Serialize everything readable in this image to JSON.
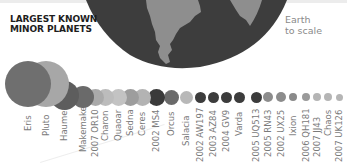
{
  "header": {
    "title_line1": "LARGEST KNOWN",
    "title_line2": "MINOR PLANETS"
  },
  "earth": {
    "label_line1": "Earth",
    "label_line2": "to scale",
    "icon": "earth-globe-icon",
    "ocean_color": "#3d3d3d",
    "land_color": "#8e8e8e"
  },
  "chart_data": {
    "type": "bubble",
    "title": "Largest Known Minor Planets",
    "note": "Earth to scale",
    "categories": [
      "Eris",
      "Pluto",
      "Haumea",
      "Makemake",
      "2007 OR10",
      "Charon",
      "Quaoar",
      "Sedna",
      "Ceres",
      "2002 MS4",
      "Orcus",
      "Salacia",
      "2002 AW197",
      "2003 AZ84",
      "2004 GV9",
      "Varda",
      "2005 UQ513",
      "2005 RN43",
      "2002 UX25",
      "Ixion",
      "2006 QH181",
      "2007 JJ43",
      "Chaos",
      "2007 UK126"
    ],
    "relative_diameter_px": [
      46,
      46,
      29,
      22,
      17,
      17,
      17,
      17,
      17,
      17,
      15,
      13,
      11,
      11,
      11,
      11,
      11,
      10,
      10,
      8,
      8,
      8,
      8,
      7
    ]
  },
  "planets": [
    {
      "name": "Eris",
      "x": 28,
      "y": 84,
      "d": 46,
      "color": "#6f6f6f"
    },
    {
      "name": "Pluto",
      "x": 46,
      "y": 84,
      "d": 46,
      "color": "#a7a7a7"
    },
    {
      "name": "Haumea",
      "x": 64,
      "y": 95,
      "d": 29,
      "color": "#5d5d5d"
    },
    {
      "name": "Makemake",
      "x": 83,
      "y": 97,
      "d": 22,
      "color": "#6a6a6a"
    },
    {
      "name": "2007 OR10",
      "x": 95,
      "y": 97,
      "d": 17,
      "color": "#aaaaaa"
    },
    {
      "name": "Charon",
      "x": 105,
      "y": 97,
      "d": 17,
      "color": "#bcbcbc"
    },
    {
      "name": "Quaoar",
      "x": 118,
      "y": 97,
      "d": 17,
      "color": "#c3c3c3"
    },
    {
      "name": "Sedna",
      "x": 130,
      "y": 97,
      "d": 17,
      "color": "#9d9d9d"
    },
    {
      "name": "Ceres",
      "x": 142,
      "y": 97,
      "d": 17,
      "color": "#b3b3b3"
    },
    {
      "name": "2002 MS4",
      "x": 156,
      "y": 97,
      "d": 17,
      "color": "#3a3a3a"
    },
    {
      "name": "Orcus",
      "x": 171,
      "y": 97,
      "d": 15,
      "color": "#6a6a6a"
    },
    {
      "name": "Salacia",
      "x": 186,
      "y": 97,
      "d": 13,
      "color": "#b8b8b8"
    },
    {
      "name": "2002 AW197",
      "x": 200,
      "y": 97,
      "d": 11,
      "color": "#3c3c3c"
    },
    {
      "name": "2003 AZ84",
      "x": 213,
      "y": 97,
      "d": 11,
      "color": "#3c3c3c"
    },
    {
      "name": "2004 GV9",
      "x": 226,
      "y": 97,
      "d": 11,
      "color": "#3c3c3c"
    },
    {
      "name": "Varda",
      "x": 239,
      "y": 97,
      "d": 11,
      "color": "#3c3c3c"
    },
    {
      "name": "2005 UQ513",
      "x": 256,
      "y": 97,
      "d": 11,
      "color": "#3c3c3c"
    },
    {
      "name": "2005 RN43",
      "x": 268,
      "y": 97,
      "d": 10,
      "color": "#8c8c8c"
    },
    {
      "name": "2002 UX25",
      "x": 281,
      "y": 97,
      "d": 10,
      "color": "#8c8c8c"
    },
    {
      "name": "Ixion",
      "x": 293,
      "y": 97,
      "d": 8,
      "color": "#8a8a8a"
    },
    {
      "name": "2006 QH181",
      "x": 306,
      "y": 97,
      "d": 8,
      "color": "#9a9a9a"
    },
    {
      "name": "2007 JJ43",
      "x": 317,
      "y": 97,
      "d": 8,
      "color": "#b5b5b5"
    },
    {
      "name": "Chaos",
      "x": 328,
      "y": 97,
      "d": 8,
      "color": "#b5b5b5"
    },
    {
      "name": "2007 UK126",
      "x": 339,
      "y": 97,
      "d": 7,
      "color": "#b5b5b5"
    }
  ]
}
